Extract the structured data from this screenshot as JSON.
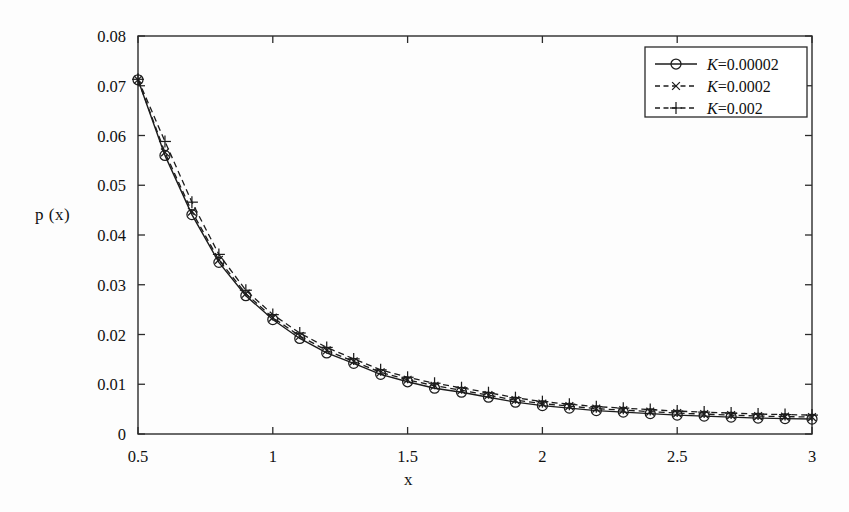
{
  "figure": {
    "background": "#fdfdfd",
    "axis_color": "#2b2b2b",
    "line_color": "#1c1c1c"
  },
  "axes": {
    "x_label": "x",
    "y_label": "p (x)",
    "x_ticks": [
      "0.5",
      "1",
      "1.5",
      "2",
      "2.5",
      "3"
    ],
    "y_ticks": [
      "0",
      "0.01",
      "0.02",
      "0.03",
      "0.04",
      "0.05",
      "0.06",
      "0.07",
      "0.08"
    ]
  },
  "legend": {
    "entries": [
      {
        "label_var": "K",
        "label": "K=0.00002",
        "value_text": "=0.00002",
        "style": "solid",
        "marker": "circle"
      },
      {
        "label_var": "K",
        "label": "K=0.0002",
        "value_text": "=0.0002",
        "style": "dashed",
        "marker": "cross-x"
      },
      {
        "label_var": "K",
        "label": "K=0.002",
        "value_text": "=0.002",
        "style": "dashed",
        "marker": "plus"
      }
    ]
  },
  "chart_data": {
    "type": "line",
    "title": "",
    "xlabel": "x",
    "ylabel": "p (x)",
    "xlim": [
      0.5,
      3
    ],
    "ylim": [
      0,
      0.08
    ],
    "xticks": [
      0.5,
      1,
      1.5,
      2,
      2.5,
      3
    ],
    "yticks": [
      0,
      0.01,
      0.02,
      0.03,
      0.04,
      0.05,
      0.06,
      0.07,
      0.08
    ],
    "grid": false,
    "legend_position": "upper right",
    "x": [
      0.5,
      0.6,
      0.7,
      0.8,
      0.9,
      1.0,
      1.1,
      1.2,
      1.3,
      1.4,
      1.5,
      1.6,
      1.7,
      1.8,
      1.9,
      2.0,
      2.1,
      2.2,
      2.3,
      2.4,
      2.5,
      2.6,
      2.7,
      2.8,
      2.9,
      3.0
    ],
    "series": [
      {
        "name": "K=0.00002",
        "marker": "circle",
        "linestyle": "solid",
        "values": [
          0.0712,
          0.056,
          0.0441,
          0.0345,
          0.0278,
          0.023,
          0.0192,
          0.0163,
          0.0142,
          0.012,
          0.0105,
          0.0092,
          0.0084,
          0.0074,
          0.0064,
          0.0057,
          0.0052,
          0.0047,
          0.0044,
          0.0041,
          0.0038,
          0.0036,
          0.0034,
          0.0032,
          0.0031,
          0.003
        ]
      },
      {
        "name": "K=0.0002",
        "marker": "cross-x",
        "linestyle": "dashed",
        "values": [
          0.0712,
          0.0566,
          0.0447,
          0.035,
          0.0282,
          0.0234,
          0.0197,
          0.0168,
          0.0146,
          0.0124,
          0.0109,
          0.0097,
          0.0088,
          0.0078,
          0.0068,
          0.0061,
          0.0056,
          0.0051,
          0.0048,
          0.0045,
          0.0042,
          0.004,
          0.0038,
          0.0036,
          0.0035,
          0.0034
        ]
      },
      {
        "name": "K=0.002",
        "marker": "plus",
        "linestyle": "dashed",
        "values": [
          0.0713,
          0.0588,
          0.0466,
          0.0361,
          0.0289,
          0.024,
          0.0203,
          0.0174,
          0.0151,
          0.0129,
          0.0114,
          0.0102,
          0.0093,
          0.0083,
          0.0073,
          0.0065,
          0.006,
          0.0055,
          0.0052,
          0.0049,
          0.0046,
          0.0044,
          0.0042,
          0.004,
          0.0039,
          0.0038
        ]
      }
    ]
  }
}
